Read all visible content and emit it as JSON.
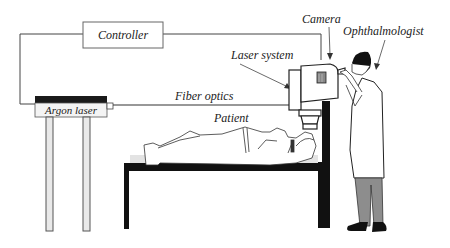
{
  "diagram": {
    "type": "equipment-schematic",
    "labels": {
      "controller": "Controller",
      "argon_laser": "Argon laser",
      "fiber_optics": "Fiber optics",
      "laser_system": "Laser system",
      "camera": "Camera",
      "ophthalmologist": "Ophthalmologist",
      "patient": "Patient"
    },
    "colors": {
      "line": "#333333",
      "fill_dark": "#111111",
      "fill_gray": "#9a9a9a",
      "background": "#ffffff"
    }
  }
}
